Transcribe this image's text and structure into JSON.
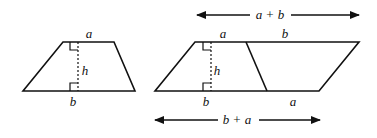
{
  "diagram": {
    "stroke_color": "#111111",
    "background": "#ffffff",
    "trapezoid": {
      "labels": {
        "top": "a",
        "height": "h",
        "bottom": "b"
      }
    },
    "parallelogram": {
      "labels": {
        "top_left": "a",
        "top_right": "b",
        "height": "h",
        "bottom_left": "b",
        "bottom_right": "a"
      },
      "top_arrow": {
        "left": "a",
        "plus": "+",
        "right": "b"
      },
      "bottom_arrow": {
        "left": "b",
        "plus": "+",
        "right": "a"
      }
    }
  }
}
